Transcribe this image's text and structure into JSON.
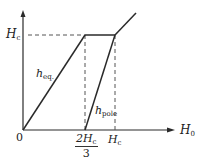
{
  "diagram": {
    "type": "piecewise-linear graph",
    "axes": {
      "x_label": {
        "main": "H",
        "sub": "0"
      },
      "y_tick_label": {
        "main": "H",
        "sub": "c"
      },
      "origin_label": "0"
    },
    "x_ticks": [
      {
        "num_main": "2H",
        "num_sub": "c",
        "den": "3"
      },
      {
        "main": "H",
        "sub": "c"
      }
    ],
    "curves": [
      {
        "label_main": "h",
        "label_sub": "eq."
      },
      {
        "label_main": "h",
        "label_sub": "pole"
      }
    ],
    "colors": {
      "line": "#2a2a2a",
      "dashed": "#555555",
      "background": "#ffffff"
    }
  }
}
